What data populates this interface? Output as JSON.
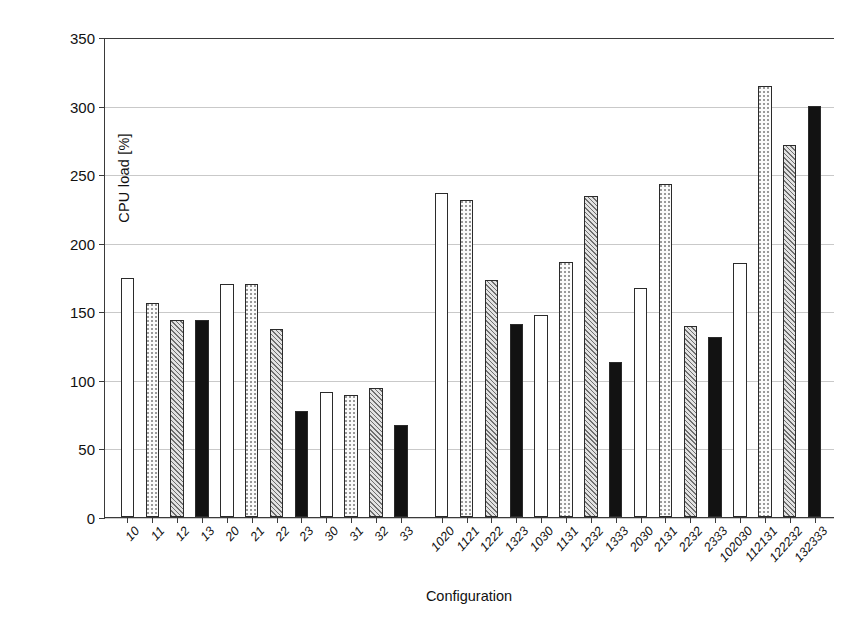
{
  "chart_data": {
    "type": "bar",
    "title": "",
    "xlabel": "Configuration",
    "ylabel": "CPU load [%]",
    "ylim": [
      0,
      350
    ],
    "ytick_step": 50,
    "yticks": [
      0,
      50,
      100,
      150,
      200,
      250,
      300,
      350
    ],
    "grid": "horizontal",
    "legend": "none",
    "categories": [
      "10",
      "11",
      "12",
      "13",
      "20",
      "21",
      "22",
      "23",
      "30",
      "31",
      "32",
      "33",
      "1020",
      "1121",
      "1222",
      "1323",
      "1030",
      "1131",
      "1232",
      "1333",
      "2030",
      "2131",
      "2232",
      "2333",
      "102030",
      "112131",
      "122232",
      "132333"
    ],
    "values": [
      174,
      156,
      144,
      144,
      170,
      170,
      137,
      77,
      91,
      89,
      94,
      67,
      236,
      231,
      173,
      141,
      147,
      186,
      234,
      113,
      167,
      243,
      139,
      131,
      185,
      314,
      271,
      300
    ],
    "fills": [
      "white",
      "dot",
      "hatch",
      "black",
      "white",
      "dot",
      "hatch",
      "black",
      "white",
      "dot",
      "hatch",
      "black",
      "white",
      "dot",
      "hatch",
      "black",
      "white",
      "dot",
      "hatch",
      "black",
      "white",
      "dot",
      "hatch",
      "black",
      "white",
      "dot",
      "hatch",
      "black"
    ],
    "group_breaks": [
      12
    ],
    "fill_legend": {
      "white": "white / unfilled bar",
      "dot": "light dotted bar",
      "hatch": "gray diagonal-hatched bar",
      "black": "solid black bar"
    },
    "colors": {
      "axis": "#3a3a3a",
      "gridline": "#c9c9c9",
      "bar_outline": "#2b2b2b",
      "bar_black": "#121212",
      "bar_hatch": "#6f6f6f",
      "background": "#ffffff"
    }
  }
}
